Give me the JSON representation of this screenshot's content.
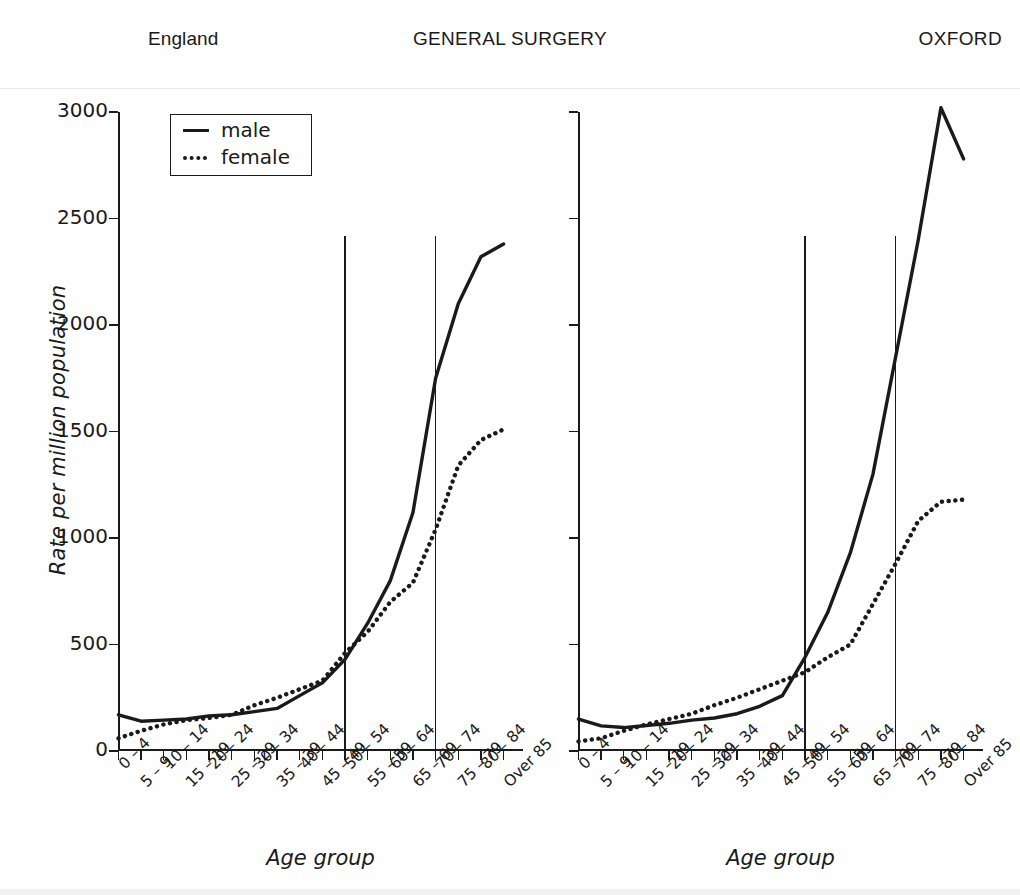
{
  "header": {
    "left": "England",
    "center": "GENERAL SURGERY",
    "right": "OXFORD"
  },
  "legend": {
    "entries": [
      {
        "label": "male",
        "style": "solid",
        "key_icon": "solid-line-icon"
      },
      {
        "label": "female",
        "style": "dotted",
        "key_icon": "dotted-line-icon"
      }
    ]
  },
  "axes": {
    "ylabel": "Rate per million population",
    "xlabel": "Age group",
    "yticks": [
      "0",
      "500",
      "1000",
      "1500",
      "2000",
      "2500",
      "3000"
    ],
    "ymin": 0,
    "ymax": 3000,
    "ystep": 500
  },
  "chart_data": [
    {
      "type": "line",
      "title": "England",
      "panel": "left",
      "xlabel": "Age group",
      "ylabel": "Rate per million population",
      "ylim": [
        0,
        3000
      ],
      "grid": false,
      "legend_position": "top-left",
      "categories": [
        "0 – 4",
        "5 – 9",
        "10 – 14",
        "15 – 19",
        "20 – 24",
        "25 – 29",
        "30 – 34",
        "35 – 39",
        "40 – 44",
        "45 – 49",
        "50 – 54",
        "55 – 59",
        "60 – 64",
        "65 – 69",
        "70 – 74",
        "75 – 79",
        "80 – 84",
        "Over 85"
      ],
      "series": [
        {
          "name": "male",
          "style": "solid",
          "values": [
            170,
            140,
            145,
            150,
            165,
            170,
            185,
            200,
            260,
            320,
            430,
            600,
            800,
            1120,
            1750,
            2100,
            2320,
            2380
          ]
        },
        {
          "name": "female",
          "style": "dotted",
          "values": [
            60,
            95,
            125,
            145,
            155,
            170,
            215,
            250,
            290,
            330,
            460,
            560,
            700,
            790,
            1040,
            1340,
            1460,
            1510
          ]
        }
      ],
      "reference_lines": [
        {
          "at_category": "50 – 54",
          "top_value": 2420
        },
        {
          "at_category": "70 – 74",
          "top_value": 2420
        }
      ]
    },
    {
      "type": "line",
      "title": "OXFORD",
      "panel": "right",
      "xlabel": "Age group",
      "ylabel": "Rate per million population",
      "ylim": [
        0,
        3000
      ],
      "grid": false,
      "legend_position": "none",
      "categories": [
        "0 – 4",
        "5 – 9",
        "10 – 14",
        "15 – 19",
        "20 – 24",
        "25 – 29",
        "30 – 34",
        "35 – 39",
        "40 – 44",
        "45 – 49",
        "50 – 54",
        "55 – 59",
        "60 – 64",
        "65 – 69",
        "70 – 74",
        "75 – 79",
        "80 – 84",
        "Over 85"
      ],
      "series": [
        {
          "name": "male",
          "style": "solid",
          "values": [
            150,
            118,
            110,
            120,
            130,
            145,
            155,
            175,
            210,
            260,
            440,
            650,
            930,
            1300,
            1850,
            2400,
            3020,
            2780
          ]
        },
        {
          "name": "female",
          "style": "dotted",
          "values": [
            45,
            60,
            95,
            125,
            150,
            175,
            215,
            250,
            290,
            330,
            370,
            440,
            500,
            690,
            880,
            1080,
            1170,
            1180
          ]
        }
      ],
      "reference_lines": [
        {
          "at_category": "50 – 54",
          "top_value": 2420
        },
        {
          "at_category": "70 – 74",
          "top_value": 2420
        }
      ]
    }
  ]
}
